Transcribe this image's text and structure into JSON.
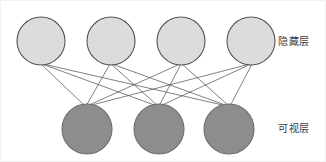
{
  "diagram": {
    "width": 326,
    "height": 162,
    "background_color": "#ffffff",
    "frame_color": "#f2f2f2"
  },
  "labels": {
    "hidden_layer": "隐藏层",
    "visible_layer": "可视层"
  },
  "layers": {
    "hidden": {
      "name": "hidden-layer",
      "label": "隐藏层",
      "node_count": 4,
      "fill_color": "#dcdcdc",
      "stroke_color": "#555555",
      "radius": 24,
      "center_y": 40,
      "nodes": [
        {
          "id": "h1",
          "cx": 40,
          "cy": 40
        },
        {
          "id": "h2",
          "cx": 110,
          "cy": 40
        },
        {
          "id": "h3",
          "cx": 180,
          "cy": 40
        },
        {
          "id": "h4",
          "cx": 250,
          "cy": 40
        }
      ]
    },
    "visible": {
      "name": "visible-layer",
      "label": "可视层",
      "node_count": 3,
      "fill_color": "#8d8d8d",
      "stroke_color": "#6d6d6d",
      "radius": 25,
      "center_y": 128,
      "nodes": [
        {
          "id": "v1",
          "cx": 86,
          "cy": 128
        },
        {
          "id": "v2",
          "cx": 158,
          "cy": 128
        },
        {
          "id": "v3",
          "cx": 228,
          "cy": 128
        }
      ]
    }
  },
  "edges": {
    "count": 12,
    "color": "#4a4a4a",
    "width": 0.7,
    "fully_connected": true,
    "list": [
      {
        "from": "h1",
        "to": "v1",
        "x1": 40,
        "y1": 63,
        "x2": 84,
        "y2": 105
      },
      {
        "from": "h1",
        "to": "v2",
        "x1": 41,
        "y1": 63,
        "x2": 156,
        "y2": 105
      },
      {
        "from": "h1",
        "to": "v3",
        "x1": 42,
        "y1": 63,
        "x2": 226,
        "y2": 105
      },
      {
        "from": "h2",
        "to": "v1",
        "x1": 109,
        "y1": 63,
        "x2": 85,
        "y2": 105
      },
      {
        "from": "h2",
        "to": "v2",
        "x1": 110,
        "y1": 63,
        "x2": 157,
        "y2": 105
      },
      {
        "from": "h2",
        "to": "v3",
        "x1": 111,
        "y1": 63,
        "x2": 227,
        "y2": 105
      },
      {
        "from": "h3",
        "to": "v1",
        "x1": 179,
        "y1": 63,
        "x2": 86,
        "y2": 105
      },
      {
        "from": "h3",
        "to": "v2",
        "x1": 180,
        "y1": 63,
        "x2": 158,
        "y2": 105
      },
      {
        "from": "h3",
        "to": "v3",
        "x1": 181,
        "y1": 63,
        "x2": 228,
        "y2": 105
      },
      {
        "from": "h4",
        "to": "v1",
        "x1": 249,
        "y1": 63,
        "x2": 87,
        "y2": 105
      },
      {
        "from": "h4",
        "to": "v2",
        "x1": 250,
        "y1": 63,
        "x2": 159,
        "y2": 105
      },
      {
        "from": "h4",
        "to": "v3",
        "x1": 251,
        "y1": 63,
        "x2": 229,
        "y2": 105
      }
    ]
  }
}
